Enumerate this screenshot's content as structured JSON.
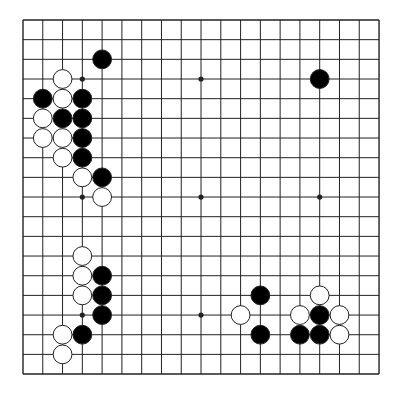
{
  "board": {
    "size": 19,
    "origin": {
      "x": 23,
      "y": 20
    },
    "spacing": {
      "x": 19.78,
      "y": 19.67
    },
    "line_color": "#222222",
    "background": "#ffffff",
    "black_stone_color": "#000000",
    "white_stone_color": "#ffffff",
    "stone_stroke": "#222222",
    "stone_radius": 9.4,
    "star_points": [
      [
        3,
        3
      ],
      [
        9,
        3
      ],
      [
        15,
        3
      ],
      [
        3,
        9
      ],
      [
        9,
        9
      ],
      [
        15,
        9
      ],
      [
        3,
        15
      ],
      [
        9,
        15
      ],
      [
        15,
        15
      ]
    ],
    "stones": [
      {
        "color": "black",
        "col": 4,
        "row": 2
      },
      {
        "color": "white",
        "col": 2,
        "row": 3
      },
      {
        "color": "black",
        "col": 1,
        "row": 4
      },
      {
        "color": "white",
        "col": 2,
        "row": 4
      },
      {
        "color": "black",
        "col": 3,
        "row": 4
      },
      {
        "color": "white",
        "col": 1,
        "row": 5
      },
      {
        "color": "black",
        "col": 2,
        "row": 5
      },
      {
        "color": "black",
        "col": 3,
        "row": 5
      },
      {
        "color": "white",
        "col": 1,
        "row": 6
      },
      {
        "color": "white",
        "col": 2,
        "row": 6
      },
      {
        "color": "black",
        "col": 3,
        "row": 6
      },
      {
        "color": "white",
        "col": 2,
        "row": 7
      },
      {
        "color": "black",
        "col": 3,
        "row": 7
      },
      {
        "color": "white",
        "col": 3,
        "row": 8
      },
      {
        "color": "black",
        "col": 4,
        "row": 8
      },
      {
        "color": "white",
        "col": 4,
        "row": 9
      },
      {
        "color": "black",
        "col": 15,
        "row": 3
      },
      {
        "color": "white",
        "col": 3,
        "row": 12
      },
      {
        "color": "white",
        "col": 3,
        "row": 13
      },
      {
        "color": "black",
        "col": 4,
        "row": 13
      },
      {
        "color": "white",
        "col": 3,
        "row": 14
      },
      {
        "color": "black",
        "col": 4,
        "row": 14
      },
      {
        "color": "black",
        "col": 4,
        "row": 15
      },
      {
        "color": "white",
        "col": 2,
        "row": 16
      },
      {
        "color": "black",
        "col": 3,
        "row": 16
      },
      {
        "color": "white",
        "col": 2,
        "row": 17
      },
      {
        "color": "black",
        "col": 12,
        "row": 14
      },
      {
        "color": "white",
        "col": 11,
        "row": 15
      },
      {
        "color": "black",
        "col": 12,
        "row": 16
      },
      {
        "color": "white",
        "col": 15,
        "row": 14
      },
      {
        "color": "white",
        "col": 14,
        "row": 15
      },
      {
        "color": "black",
        "col": 15,
        "row": 15
      },
      {
        "color": "white",
        "col": 16,
        "row": 15
      },
      {
        "color": "black",
        "col": 14,
        "row": 16
      },
      {
        "color": "black",
        "col": 15,
        "row": 16
      },
      {
        "color": "white",
        "col": 16,
        "row": 16
      }
    ]
  }
}
